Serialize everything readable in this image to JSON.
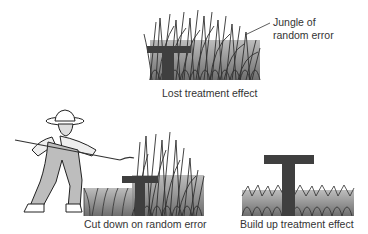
{
  "panels": {
    "top": {
      "caption": "Lost treatment effect",
      "callout_line1": "Jungle of",
      "callout_line2": "random error",
      "letter": "T"
    },
    "bottom_left": {
      "caption": "Cut down on random error",
      "letter": "T"
    },
    "bottom_right": {
      "caption": "Build up treatment effect",
      "letter": "T"
    }
  },
  "colors": {
    "grass_fill": "#8a8a8a",
    "grass_stroke": "#3a3a3a",
    "t_fill": "#4a4a4a",
    "text": "#333333"
  }
}
